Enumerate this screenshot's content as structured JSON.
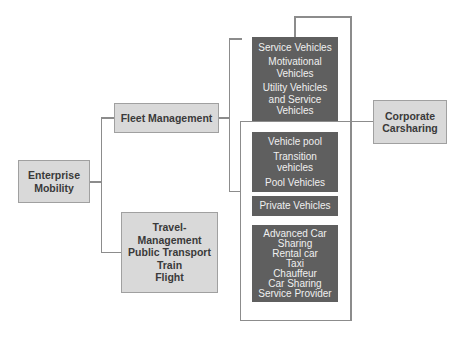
{
  "diagram": {
    "root": {
      "label": "Enterprise Mobility"
    },
    "branches": [
      {
        "label": "Fleet Management"
      },
      {
        "label": "Travel-Management Public Transport Train Flight",
        "lines": [
          "Travel-",
          "Management",
          "Public Transport",
          "Train",
          "Flight"
        ]
      }
    ],
    "vehicle_groups": [
      {
        "lines": [
          "Service Vehicles",
          "Motivational Vehicles",
          "Utility Vehicles and Service Vehicles"
        ],
        "display": [
          "Service Vehicles",
          "Motivational",
          "Vehicles",
          "Utility Vehicles",
          "and Service",
          "Vehicles"
        ]
      },
      {
        "lines": [
          "Vehicle pool",
          "Transition vehicles",
          "Pool Vehicles"
        ],
        "display": [
          "Vehicle pool",
          "Transition",
          "vehicles",
          "Pool Vehicles"
        ]
      },
      {
        "lines": [
          "Private Vehicles"
        ],
        "display": [
          "Private Vehicles"
        ]
      },
      {
        "lines": [
          "Advanced Car Sharing",
          "Rental car",
          "Taxi",
          "Chauffeur",
          "Car Sharing Service Provider"
        ],
        "display": [
          "Advanced Car",
          "Sharing",
          "Rental car",
          "Taxi",
          "Chauffeur",
          "Car Sharing",
          "Service Provider"
        ]
      }
    ],
    "target": {
      "label": "Corporate Carsharing",
      "lines": [
        "Corporate",
        "Carsharing"
      ]
    },
    "colors": {
      "light_box_fill": "#d9d9d9",
      "dark_box_fill": "#5f5f5f",
      "connector": "#8c8c8c",
      "light_text": "#3a3a3a",
      "dark_text": "#f0f0f0"
    }
  }
}
